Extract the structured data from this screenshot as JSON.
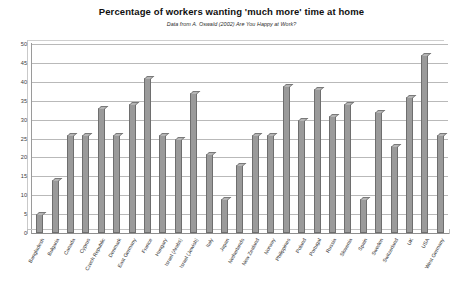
{
  "chart_data": {
    "type": "bar",
    "title": "Percentage of workers wanting 'much more' time at home",
    "subtitle": "Data from A. Oswald (2002) Are You Happy at Work?",
    "xlabel": "",
    "ylabel": "",
    "ylim": [
      0,
      50
    ],
    "ytick_step": 5,
    "yticks": [
      0,
      5,
      10,
      15,
      20,
      25,
      30,
      35,
      40,
      45,
      50
    ],
    "grid": "horizontal",
    "legend": "none",
    "bar_color": "#9a9a9a",
    "bar_edge_color": "#6e6e6e",
    "categories": [
      "Bangladesh",
      "Bulgaria",
      "Canada",
      "Cyprus",
      "Czech Republic",
      "Denmark",
      "East Germany",
      "France",
      "Hungary",
      "Israel (Arabs)",
      "Israel (Jewish)",
      "Italy",
      "Japan",
      "Netherlands",
      "New Zealand",
      "Norway",
      "Philippines",
      "Poland",
      "Portugal",
      "Russia",
      "Slovenia",
      "Spain",
      "Sweden",
      "Switzerland",
      "UK",
      "USA",
      "West Germany"
    ],
    "values": [
      5,
      14,
      26,
      26,
      33,
      26,
      34,
      41,
      26,
      25,
      37,
      21,
      9,
      18,
      26,
      26,
      39,
      30,
      38,
      31,
      34,
      9,
      32,
      23,
      36,
      47,
      26
    ]
  }
}
